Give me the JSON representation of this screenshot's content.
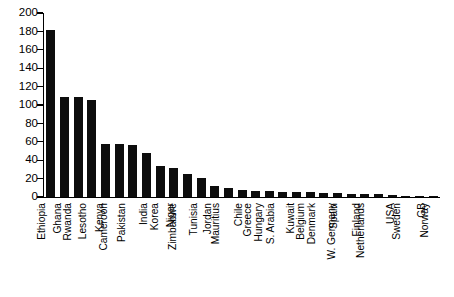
{
  "chart_data": {
    "type": "bar",
    "title": "",
    "subtitle": "",
    "xlabel": "",
    "ylabel": "",
    "ylim": [
      0,
      200
    ],
    "yticks": [
      0,
      20,
      40,
      60,
      80,
      100,
      120,
      140,
      160,
      180,
      200
    ],
    "grid": false,
    "legend": false,
    "bar_color": "#0d0d0d",
    "orientation": "vertical",
    "xtick_rotation": -90,
    "categories": [
      "Ethiopia",
      "Ghana",
      "Rwanda",
      "Lesotho",
      "Kenya",
      "Cameroon",
      "Pakistan",
      "India",
      "Korea",
      "Niger",
      "Zimbabwe",
      "Tunisia",
      "Jordan",
      "Mauritius",
      "Chile",
      "Greece",
      "Hungary",
      "S. Arabia",
      "Kuwait",
      "Belgium",
      "Denmark",
      "Spain",
      "W. Germany",
      "Finland",
      "Netherlands",
      "USA",
      "Sweden",
      "GB",
      "Norway"
    ],
    "values": [
      182,
      109,
      109,
      105,
      58,
      58,
      56,
      48,
      34,
      32,
      25,
      21,
      12,
      10,
      8,
      6.5,
      6.5,
      5.5,
      5.5,
      5,
      4.5,
      4,
      3.5,
      3.5,
      3.5,
      2,
      1.5,
      1.5,
      1.5
    ]
  }
}
